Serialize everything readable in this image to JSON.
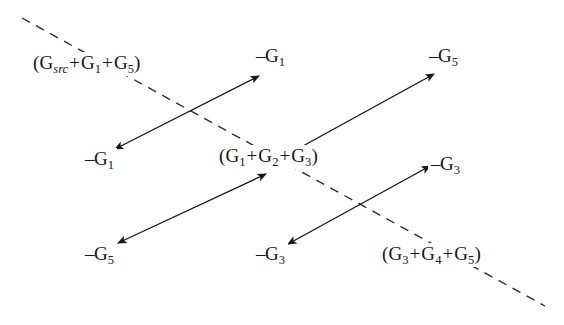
{
  "figure": {
    "type": "signal-flow-graph-cutset-diagram",
    "background_color": "#ffffff",
    "ink_color": "#15171a",
    "width": 564,
    "height": 325
  },
  "labels": {
    "top_left_cut": {
      "text": "(G_src + G_1 + G_5)",
      "parts": {
        "open": "(",
        "t1": "G",
        "s1": "src",
        "p1": "+",
        "t2": "G",
        "s2": "1",
        "p2": "+",
        "t3": "G",
        "s3": "5",
        "close": ")"
      },
      "x": 30,
      "y": 52
    },
    "center_cut": {
      "text": "(G_1 + G_2 + G_3)",
      "parts": {
        "open": "(",
        "t1": "G",
        "s1": "1",
        "p1": "+",
        "t2": "G",
        "s2": "2",
        "p2": "+",
        "t3": "G",
        "s3": "3",
        "close": ")"
      },
      "x": 216,
      "y": 145
    },
    "bottom_right_cut": {
      "text": "(G_3 + G_4 + G_5)",
      "parts": {
        "open": "(",
        "t1": "G",
        "s1": "3",
        "p1": "+",
        "t2": "G",
        "s2": "4",
        "p2": "+",
        "t3": "G",
        "s3": "5",
        "close": ")"
      },
      "x": 379,
      "y": 243
    },
    "node_top_center": {
      "sign": "–",
      "base": "G",
      "sub": "1",
      "x": 253,
      "y": 45
    },
    "node_top_right": {
      "sign": "–",
      "base": "G",
      "sub": "5",
      "x": 426,
      "y": 45
    },
    "node_mid_left": {
      "sign": "–",
      "base": "G",
      "sub": "1",
      "x": 82,
      "y": 148
    },
    "node_mid_right": {
      "sign": "–",
      "base": "G",
      "sub": "3",
      "x": 428,
      "y": 153
    },
    "node_bottom_left": {
      "sign": "–",
      "base": "G",
      "sub": "5",
      "x": 82,
      "y": 243
    },
    "node_bottom_center": {
      "sign": "–",
      "base": "G",
      "sub": "3",
      "x": 253,
      "y": 243
    }
  },
  "dashed_cut_line": {
    "style": "dashed",
    "x1": 22,
    "y1": 18,
    "x2": 545,
    "y2": 306
  },
  "arrows": [
    {
      "name": "arrow-g1-pair",
      "heads": "both",
      "x1": 115,
      "y1": 149,
      "x2": 259,
      "y2": 76
    },
    {
      "name": "arrow-g5-up",
      "heads": "end",
      "x1": 292,
      "y1": 152,
      "x2": 434,
      "y2": 74
    },
    {
      "name": "arrow-g5-down",
      "heads": "both",
      "x1": 266,
      "y1": 174,
      "x2": 118,
      "y2": 243
    },
    {
      "name": "arrow-g3-pair",
      "heads": "both",
      "x1": 288,
      "y1": 244,
      "x2": 430,
      "y2": 166
    }
  ]
}
